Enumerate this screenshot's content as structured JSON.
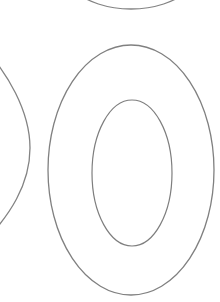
{
  "canvas": {
    "width": 220,
    "height": 302,
    "background_color": "#ffffff",
    "title": "Glyph Outline Canvas",
    "description": "Zoomed outline view of a letter O glyph with neighboring glyph arcs"
  },
  "style": {
    "stroke_color": "#808080",
    "stroke_width": 1.3,
    "fill": "none"
  },
  "shapes": {
    "outer_ellipse": {
      "name": "outer-ellipse",
      "cx": 131,
      "cy": 170,
      "rx": 83,
      "ry": 125,
      "stroke_color": "#808080",
      "stroke_width": 1.3
    },
    "inner_ellipse": {
      "name": "inner-ellipse",
      "cx": 132,
      "cy": 173,
      "rx": 40,
      "ry": 73,
      "stroke_color": "#7e7e7e",
      "stroke_width": 1.2
    },
    "left_partial_arc": {
      "name": "left-partial-arc",
      "path": "M -14 50 C 6 72, 30 110, 30 148 C 30 186, 8 216, -12 238",
      "stroke_color": "#838383",
      "stroke_width": 1.3
    },
    "top_partial_arc": {
      "name": "top-partial-arc",
      "path": "M 74 -10 C 86 2, 108 9, 131 9 C 154 9, 176 2, 188 -10",
      "stroke_color": "#838383",
      "stroke_width": 1.3
    }
  }
}
